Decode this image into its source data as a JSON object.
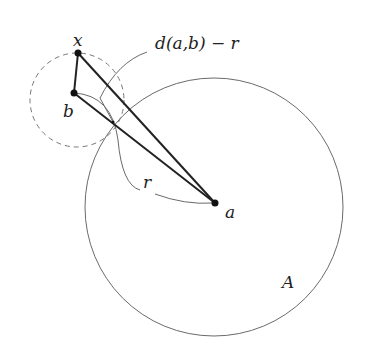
{
  "diagram": {
    "labels": {
      "x": "x",
      "b": "b",
      "a": "a",
      "r": "r",
      "A": "A",
      "distance": "d(a,b) − r"
    },
    "points": {
      "x": [
        78,
        53
      ],
      "b": [
        74,
        93
      ],
      "a": [
        215,
        203
      ]
    },
    "circles": {
      "A": {
        "cx": 214,
        "cy": 207,
        "r": 129,
        "style": "solid"
      },
      "ball_b": {
        "cx": 77,
        "cy": 100,
        "r": 47,
        "style": "dashed"
      }
    },
    "colors": {
      "line": "#222222",
      "circle": "#6a6a6a",
      "dashed": "#777777"
    }
  }
}
